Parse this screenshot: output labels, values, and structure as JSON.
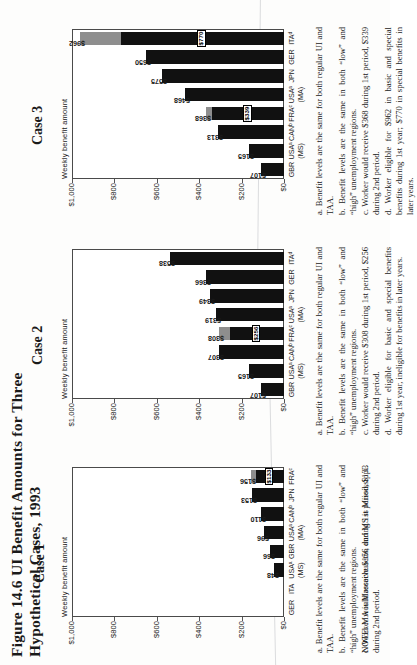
{
  "figure": {
    "title": "Figure 14.6  UI Benefit Amounts for Three Hypothetical Cases, 1993",
    "note": "NOTE: MA is Massachusetts, and MS is Mississippi.",
    "y_axis_label": "Weekly benefit amount",
    "y_ticks": [
      "$1,000",
      "$800",
      "$600",
      "$400",
      "$200",
      "$0"
    ],
    "y_max": 1000
  },
  "chart_data": [
    {
      "type": "bar",
      "title": "Case 1",
      "ylabel": "Weekly benefit amount",
      "xlabel": "",
      "ylim": [
        0,
        1000
      ],
      "ytick_labels": [
        "$1,000",
        "$800",
        "$600",
        "$400",
        "$200",
        "$0"
      ],
      "grid": false,
      "categories": [
        "GER",
        "ITA",
        "USAᵃ",
        "GBR",
        "USAᵃ",
        "CANᵇ",
        "JPN",
        "FRAᶜ"
      ],
      "category_sublabels": [
        "",
        "",
        "(MS)",
        "",
        "(MA)",
        "",
        "",
        ""
      ],
      "values": [
        0,
        0,
        48,
        66,
        96,
        110,
        153,
        156
      ],
      "value_labels": [
        "",
        "",
        "$48",
        "$66",
        "$96",
        "$110",
        "$153",
        "$156"
      ],
      "segments": [
        [],
        [],
        [
          {
            "value": 48,
            "style": "dark"
          }
        ],
        [
          {
            "value": 66,
            "style": "dark"
          }
        ],
        [
          {
            "value": 96,
            "style": "dark"
          }
        ],
        [
          {
            "value": 110,
            "style": "dark"
          }
        ],
        [
          {
            "value": 153,
            "style": "dark"
          }
        ],
        [
          {
            "value": 133,
            "style": "dark",
            "inner_label": "$133"
          },
          {
            "value": 23,
            "style": "gray"
          }
        ]
      ]
    },
    {
      "type": "bar",
      "title": "Case 2",
      "ylabel": "Weekly benefit amount",
      "xlabel": "",
      "ylim": [
        0,
        1000
      ],
      "ytick_labels": [
        "$1,000",
        "$800",
        "$600",
        "$400",
        "$200",
        "$0"
      ],
      "grid": false,
      "categories": [
        "GBR",
        "USAᵃ",
        "CANᵇ",
        "FRAᶜ",
        "USAᵃ",
        "JPN",
        "GER",
        "ITAᵈ"
      ],
      "category_sublabels": [
        "",
        "(MS)",
        "",
        "",
        "(MA)",
        "",
        "",
        ""
      ],
      "values": [
        107,
        165,
        307,
        308,
        319,
        349,
        366,
        538
      ],
      "value_labels": [
        "$107",
        "$165",
        "$307",
        "$308",
        "$319",
        "$349",
        "$366",
        "$538"
      ],
      "segments": [
        [
          {
            "value": 107,
            "style": "dark"
          }
        ],
        [
          {
            "value": 165,
            "style": "dark"
          }
        ],
        [
          {
            "value": 307,
            "style": "dark"
          }
        ],
        [
          {
            "value": 256,
            "style": "dark",
            "inner_label": "$256"
          },
          {
            "value": 52,
            "style": "gray"
          }
        ],
        [
          {
            "value": 319,
            "style": "dark"
          }
        ],
        [
          {
            "value": 349,
            "style": "dark"
          }
        ],
        [
          {
            "value": 366,
            "style": "dark"
          }
        ],
        [
          {
            "value": 538,
            "style": "dark"
          }
        ]
      ]
    },
    {
      "type": "bar",
      "title": "Case 3",
      "ylabel": "Weekly benefit amount",
      "xlabel": "",
      "ylim": [
        0,
        1000
      ],
      "ytick_labels": [
        "$1,000",
        "$800",
        "$600",
        "$400",
        "$200",
        "$0"
      ],
      "grid": false,
      "categories": [
        "GBR",
        "USAᵃ",
        "CANᵇ",
        "FRAᶜ",
        "USAᵃ",
        "JPN",
        "GER",
        "ITAᵈ"
      ],
      "category_sublabels": [
        "",
        "(MS)",
        "",
        "",
        "(MA)",
        "",
        "",
        ""
      ],
      "values": [
        107,
        165,
        313,
        368,
        468,
        575,
        650,
        962
      ],
      "value_labels": [
        "$107",
        "$165",
        "$313",
        "$368",
        "$468",
        "$575",
        "$650",
        "$962"
      ],
      "segments": [
        [
          {
            "value": 107,
            "style": "dark"
          }
        ],
        [
          {
            "value": 165,
            "style": "dark"
          }
        ],
        [
          {
            "value": 313,
            "style": "dark"
          }
        ],
        [
          {
            "value": 339,
            "style": "dark",
            "inner_label": "$339"
          },
          {
            "value": 29,
            "style": "gray"
          }
        ],
        [
          {
            "value": 468,
            "style": "dark"
          }
        ],
        [
          {
            "value": 575,
            "style": "dark"
          }
        ],
        [
          {
            "value": 650,
            "style": "dark"
          }
        ],
        [
          {
            "value": 770,
            "style": "dark",
            "inner_label": "$770"
          },
          {
            "value": 192,
            "style": "gray"
          }
        ]
      ]
    }
  ],
  "footnotes": {
    "case1": [
      "a. Benefit levels are the same for both regular UI and TAA.",
      "b. Benefit levels are the same in both “low” and “high” unemployment regions.",
      "c. Worker would receive $156 during 1st period, $133 during 2nd period."
    ],
    "case2": [
      "a. Benefit levels are the same for both regular UI and TAA.",
      "b. Benefit levels are the same in both “low” and “high” unemployment regions.",
      "c. Worker would receive $308 during 1st period, $256 during 2nd period.",
      "d. Worker eligible for basic and special benefits during 1st year, ineligible for benefits in later years."
    ],
    "case3": [
      "a. Benefit levels are the same for both regular UI and TAA.",
      "b. Benefit levels are the same in both “low” and “high” unemployment regions.",
      "c. Worker would receive $368 during 1st period, $339 during 2nd period.",
      "d. Worker eligible for $962 in basic and special benefits during 1st year; $770 in special benefits in later years."
    ]
  }
}
